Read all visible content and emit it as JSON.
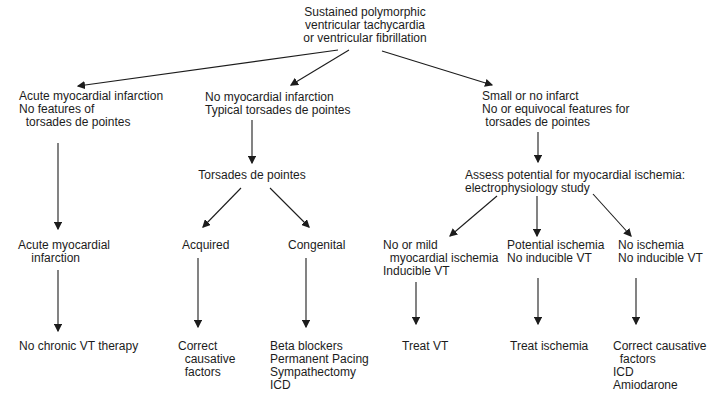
{
  "figure": {
    "type": "flowchart",
    "background": "#ffffff",
    "text_color": "#1c1c1c",
    "nodes": {
      "root": "Sustained polymorphic\nventricular tachycardia\nor ventricular fibrillation",
      "branch_left": "Acute myocardial infarction\nNo features of\n  torsades de pointes",
      "branch_middle": "No myocardial infarction\nTypical torsades de pointes",
      "branch_right": "Small or no infarct\nNo or equivocal features for\n torsades de pointes",
      "torsades": "Torsades de pointes",
      "assess": "Assess potential for myocardial ischemia:\nelectrophysiology study",
      "acute_mi": "Acute myocardial\n    infarction",
      "acquired": "Acquired",
      "congenital": "Congenital",
      "no_mild_ischemia": "No or mild\n  myocardial ischemia\nInducible VT",
      "potential_ischemia": "Potential ischemia\nNo inducible VT",
      "no_ischemia": "No ischemia\nNo inducible VT",
      "no_chronic_therapy": "No chronic VT therapy",
      "correct_causative": "Correct\n  causative\n  factors",
      "beta_blockers": "Beta blockers\nPermanent Pacing\nSympathectomy\nICD",
      "treat_vt": "Treat VT",
      "treat_ischemia": "Treat ischemia",
      "correct_causative_icd": "Correct causative\n  factors\nICD\nAmiodarone"
    }
  }
}
